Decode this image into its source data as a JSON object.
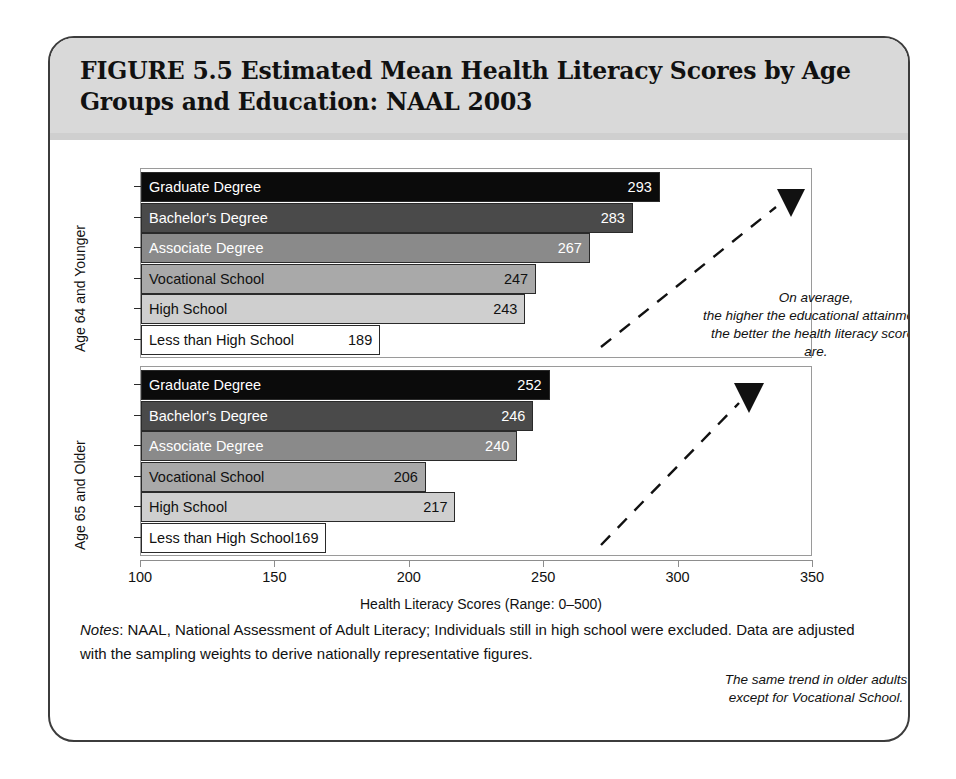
{
  "figure": {
    "title": "FIGURE 5.5  Estimated Mean Health Literacy Scores by Age\nGroups and Education: NAAL 2003",
    "notes_label": "Notes",
    "notes_text": ": NAAL, National Assessment of Adult Literacy; Individuals still in high school were excluded. Data are adjusted with the sampling weights to derive nationally representative figures."
  },
  "axis": {
    "x_title": "Health Literacy Scores (Range: 0–500)",
    "x_ticks": [
      "100",
      "150",
      "200",
      "250",
      "300",
      "350"
    ],
    "y_title_young": "Age 64 and Younger",
    "y_title_old": "Age 65 and Older"
  },
  "annotations": {
    "young": "On average,\nthe higher the educational attainment,\nthe better the health literacy scores are.",
    "old": "The same trend in older adults\nexcept for Vocational School."
  },
  "labels": {
    "graduate": "Graduate Degree",
    "bachelor": "Bachelor's Degree",
    "associate": "Associate Degree",
    "vocational": "Vocational School",
    "high_school": "High School",
    "less_than_high_school": "Less than High School"
  },
  "values": {
    "young": {
      "graduate": "293",
      "bachelor": "283",
      "associate": "267",
      "vocational": "247",
      "high_school": "243",
      "less_than_high_school": "189"
    },
    "old": {
      "graduate": "252",
      "bachelor": "246",
      "associate": "240",
      "vocational": "206",
      "high_school": "217",
      "less_than_high_school": "169"
    }
  },
  "colors": {
    "graduate": "#0b0b0b",
    "bachelor": "#4a4a4a",
    "associate": "#8a8a8a",
    "vocational": "#a9a9a9",
    "high_school": "#cfcfcf",
    "less_than_high_school": "#ffffff",
    "border": "#2a2a2a",
    "header_band": "#d9d9d9",
    "frame": "#3c3c3c"
  },
  "chart_data": {
    "type": "bar",
    "title": "FIGURE 5.5  Estimated Mean Health Literacy Scores by Age Groups and Education: NAAL 2003",
    "orientation": "horizontal",
    "xlabel": "Health Literacy Scores (Range: 0–500)",
    "ylabel": "",
    "xlim": [
      100,
      350
    ],
    "xticks": [
      100,
      150,
      200,
      250,
      300,
      350
    ],
    "grid": false,
    "legend": "none",
    "categories": [
      "Graduate Degree",
      "Bachelor's Degree",
      "Associate Degree",
      "Vocational School",
      "High School",
      "Less than High School"
    ],
    "panels": [
      {
        "name": "Age 64 and Younger",
        "values": [
          293,
          283,
          267,
          247,
          243,
          189
        ],
        "annotation": "On average, the higher the educational attainment, the better the health literacy scores are."
      },
      {
        "name": "Age 65 and Older",
        "values": [
          252,
          246,
          240,
          206,
          217,
          169
        ],
        "annotation": "The same trend in older adults except for Vocational School."
      }
    ],
    "series": [
      {
        "name": "Age 64 and Younger",
        "values": [
          293,
          283,
          267,
          247,
          243,
          189
        ]
      },
      {
        "name": "Age 65 and Older",
        "values": [
          252,
          246,
          240,
          206,
          217,
          169
        ]
      }
    ],
    "notes": "NAAL, National Assessment of Adult Literacy; Individuals still in high school were excluded. Data are adjusted with the sampling weights to derive nationally representative figures."
  }
}
